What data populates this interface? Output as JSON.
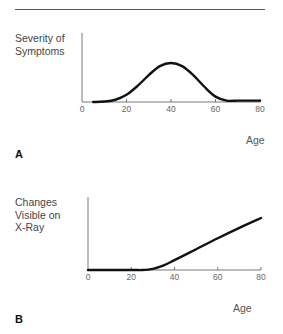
{
  "chart_data": [
    {
      "type": "line",
      "panel": "A",
      "title": "",
      "xlabel": "Age",
      "ylabel": "Severity of Symptoms",
      "ylabel_lines": [
        "Severity of",
        "Symptoms"
      ],
      "x_ticks": [
        0,
        20,
        40,
        60,
        80
      ],
      "xlim": [
        0,
        80
      ],
      "ylim": [
        0,
        1
      ],
      "grid": false,
      "series": [
        {
          "name": "Severity of Symptoms",
          "x": [
            5,
            10,
            15,
            20,
            25,
            30,
            35,
            40,
            45,
            50,
            55,
            60,
            65,
            70,
            75,
            80
          ],
          "values": [
            0.0,
            0.01,
            0.05,
            0.16,
            0.36,
            0.6,
            0.8,
            0.87,
            0.8,
            0.6,
            0.34,
            0.12,
            0.03,
            0.03,
            0.03,
            0.03
          ]
        }
      ]
    },
    {
      "type": "line",
      "panel": "B",
      "title": "",
      "xlabel": "Age",
      "ylabel": "Changes Visible on X-Ray",
      "ylabel_lines": [
        "Changes",
        "Visible on",
        "X-Ray"
      ],
      "x_ticks": [
        0,
        20,
        40,
        60,
        80
      ],
      "xlim": [
        0,
        80
      ],
      "ylim": [
        0,
        1
      ],
      "grid": false,
      "series": [
        {
          "name": "Changes Visible on X-Ray",
          "x": [
            0,
            20,
            25,
            30,
            35,
            40,
            50,
            60,
            70,
            80
          ],
          "values": [
            0.0,
            0.0,
            0.0,
            0.02,
            0.08,
            0.17,
            0.36,
            0.55,
            0.73,
            0.9
          ]
        }
      ]
    }
  ],
  "panels": {
    "a": {
      "letter": "A",
      "ylabel_line1": "Severity of",
      "ylabel_line2": "Symptoms",
      "xlabel": "Age",
      "ticks": [
        "0",
        "20",
        "40",
        "60",
        "80"
      ]
    },
    "b": {
      "letter": "B",
      "ylabel_line1": "Changes",
      "ylabel_line2": "Visible on",
      "ylabel_line3": "X-Ray",
      "xlabel": "Age",
      "ticks": [
        "0",
        "20",
        "40",
        "60",
        "80"
      ]
    }
  }
}
